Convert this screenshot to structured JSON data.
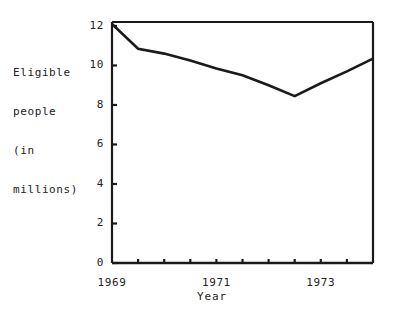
{
  "chart_data": {
    "type": "line",
    "title": "",
    "xlabel": "Year",
    "ylabel": "Eligible people (in millions)",
    "ylabel_lines": [
      "Eligible",
      "people",
      "(in",
      "millions)"
    ],
    "x": [
      1969,
      1969.5,
      1970,
      1970.5,
      1971,
      1971.5,
      1972,
      1972.5,
      1973,
      1973.5,
      1974
    ],
    "values": [
      12.1,
      10.85,
      10.6,
      10.25,
      9.85,
      9.5,
      9.0,
      8.45,
      9.1,
      9.7,
      10.35
    ],
    "series": [
      {
        "name": "Eligible people",
        "values": [
          12.1,
          10.85,
          10.6,
          10.25,
          9.85,
          9.5,
          9.0,
          8.45,
          9.1,
          9.7,
          10.35
        ]
      }
    ],
    "xlim": [
      1969,
      1974
    ],
    "ylim": [
      0,
      12.2
    ],
    "yticks": [
      0,
      2,
      4,
      6,
      8,
      10,
      12
    ],
    "ytick_labels": [
      "0",
      "2",
      "4",
      "6",
      "8",
      "10",
      "12"
    ],
    "xticks": [
      1969,
      1969.5,
      1970,
      1970.5,
      1971,
      1971.5,
      1972,
      1972.5,
      1973,
      1973.5,
      1974
    ],
    "xtick_labels_shown": [
      {
        "value": 1969,
        "label": "1969"
      },
      {
        "value": 1971,
        "label": "1971"
      },
      {
        "value": 1973,
        "label": "1973"
      }
    ],
    "grid": false,
    "legend": "none",
    "line_color": "#1a1a1a",
    "axis_color": "#1a1a1a",
    "background": "#ffffff"
  }
}
